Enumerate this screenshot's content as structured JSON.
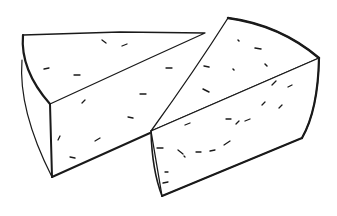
{
  "image": {
    "subject": "Line drawing of two cheese wedges",
    "alt": "Two cheese wedges sketched in black ink on white background",
    "stroke_color": "#1a1a1a",
    "background_color": "#ffffff"
  },
  "wedges": [
    {
      "name": "left-cheese-wedge"
    },
    {
      "name": "right-cheese-wedge"
    }
  ]
}
